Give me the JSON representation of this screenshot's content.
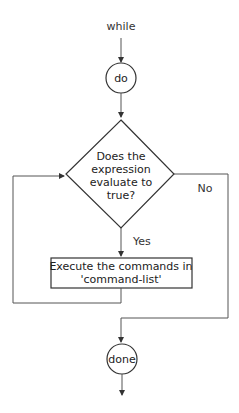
{
  "diagram": {
    "type": "flowchart",
    "start_label": "while",
    "nodes": {
      "do": {
        "label": "do",
        "shape": "circle"
      },
      "condition": {
        "shape": "diamond",
        "lines": [
          "Does the",
          "expression",
          "evaluate to",
          "true?"
        ]
      },
      "process": {
        "shape": "rectangle",
        "lines": [
          "Execute the commands in",
          "'command-list'"
        ]
      },
      "done": {
        "label": "done",
        "shape": "circle"
      }
    },
    "edges": {
      "yes_label": "Yes",
      "no_label": "No"
    },
    "colors": {
      "line": "#555555",
      "text": "#222222",
      "background": "#ffffff"
    }
  }
}
